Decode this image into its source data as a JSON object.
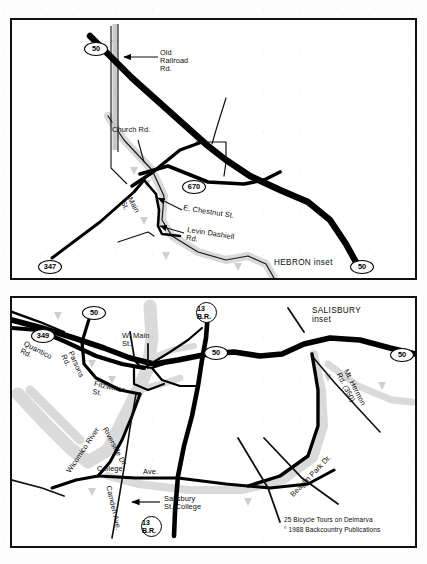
{
  "page": {
    "background": "#ffffff",
    "ink": "#000000",
    "water_color": "#d9d9d9",
    "road_color": "#000000",
    "panel_count": 2
  },
  "hebron": {
    "inset_title": "HEBRON inset",
    "shields": [
      {
        "id": "us50-nw",
        "label": "50",
        "shape": "oval",
        "x": 72,
        "y": 22
      },
      {
        "id": "md670",
        "label": "670",
        "shape": "oval",
        "x": 170,
        "y": 160
      },
      {
        "id": "md347",
        "label": "347",
        "shape": "oval",
        "x": 26,
        "y": 240
      },
      {
        "id": "us50-se",
        "label": "50",
        "shape": "oval",
        "x": 338,
        "y": 256
      }
    ],
    "labels": [
      {
        "id": "old-railroad-rd",
        "text": "Old\nRailroad\nRd.",
        "x": 148,
        "y": 32,
        "rotate": 0
      },
      {
        "id": "church-rd",
        "text": "Church Rd.",
        "x": 100,
        "y": 110,
        "rotate": 0
      },
      {
        "id": "main-st",
        "text": "Main\nSt.",
        "x": 121,
        "y": 178,
        "rotate": 62
      },
      {
        "id": "e-chestnut-st",
        "text": "E. Chestnut St.",
        "x": 172,
        "y": 186,
        "rotate": 9
      },
      {
        "id": "levin-dashiell",
        "text": "Levin Dashiell\nRd.",
        "x": 176,
        "y": 209,
        "rotate": 9
      }
    ]
  },
  "salisbury": {
    "inset_title": "SALISBURY\ninset",
    "shields": [
      {
        "id": "us50-nw2",
        "label": "50",
        "shape": "oval",
        "x": 70,
        "y": 8
      },
      {
        "id": "md349",
        "label": "349",
        "shape": "oval",
        "x": 19,
        "y": 31
      },
      {
        "id": "br13-top",
        "label": "13\nB.R.",
        "shape": "circle",
        "x": 184,
        "y": 4
      },
      {
        "id": "us50-mid",
        "label": "50",
        "shape": "oval",
        "x": 192,
        "y": 48
      },
      {
        "id": "us50-east",
        "label": "50",
        "shape": "oval",
        "x": 382,
        "y": 50
      },
      {
        "id": "br13-bot",
        "label": "13\nB.R.",
        "shape": "circle",
        "x": 129,
        "y": 224
      }
    ],
    "labels": [
      {
        "id": "quantico-rd",
        "text": "Quantico\nRd.",
        "x": 14,
        "y": 44,
        "rotate": 27
      },
      {
        "id": "parsons-rd",
        "text": "Parsons\nRd.",
        "x": 62,
        "y": 54,
        "rotate": 66
      },
      {
        "id": "w-main-st",
        "text": "W. Main\nSt.",
        "x": 110,
        "y": 36,
        "rotate": 0
      },
      {
        "id": "fitzwater-st",
        "text": "Fitzwater\nSt.",
        "x": 83,
        "y": 84,
        "rotate": 12
      },
      {
        "id": "wicomico-river",
        "text": "Wicomico River",
        "x": 53,
        "y": 172,
        "rotate": -56
      },
      {
        "id": "riverside-dr",
        "text": "Riverside Dr.",
        "x": 96,
        "y": 130,
        "rotate": 62
      },
      {
        "id": "college-ave-a",
        "text": "College",
        "x": 85,
        "y": 169,
        "rotate": 0
      },
      {
        "id": "college-ave-b",
        "text": "Ave.",
        "x": 131,
        "y": 172,
        "rotate": 0
      },
      {
        "id": "camden-ave",
        "text": "Camden Ave.",
        "x": 100,
        "y": 189,
        "rotate": 77
      },
      {
        "id": "salisbury-state",
        "text": "Salisbury\nSt. College",
        "x": 152,
        "y": 200,
        "rotate": 0
      },
      {
        "id": "beaglin-park-dr",
        "text": "Beaglin Park Dr.",
        "x": 277,
        "y": 195,
        "rotate": -46
      },
      {
        "id": "mt-hermon-rd",
        "text": "Mt. Hermon\nRd. (350)",
        "x": 337,
        "y": 72,
        "rotate": 63
      }
    ],
    "credit": {
      "line1": "25 Bicycle Tours on Delmarva",
      "line2": "° 1988 Backcountry Publications"
    }
  }
}
